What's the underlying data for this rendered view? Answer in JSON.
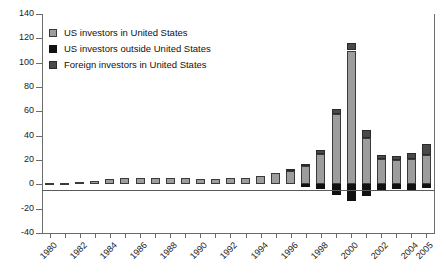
{
  "chart_data": {
    "type": "bar",
    "stacked": true,
    "title": "",
    "subtitle": "",
    "xlabel": "",
    "ylabel": "",
    "ylim": [
      -40,
      140
    ],
    "ytick_step": 20,
    "yticks": [
      140,
      120,
      100,
      80,
      60,
      40,
      20,
      0,
      -20,
      -40
    ],
    "ytick_labels": [
      "140",
      "120",
      "100",
      "80",
      "60",
      "40",
      "20",
      "0",
      "-20",
      "-40"
    ],
    "grid": false,
    "legend_position": "top-left",
    "x": [
      1980,
      1981,
      1982,
      1983,
      1984,
      1985,
      1986,
      1987,
      1988,
      1989,
      1990,
      1991,
      1992,
      1993,
      1994,
      1995,
      1996,
      1997,
      1998,
      1999,
      2000,
      2001,
      2002,
      2003,
      2004,
      2005
    ],
    "categories": [
      "1980",
      "1981",
      "1982",
      "1983",
      "1984",
      "1985",
      "1986",
      "1987",
      "1988",
      "1989",
      "1990",
      "1991",
      "1992",
      "1993",
      "1994",
      "1995",
      "1996",
      "1997",
      "1998",
      "1999",
      "2000",
      "2001",
      "2002",
      "2003",
      "2004",
      "2005"
    ],
    "xtick_labels": [
      "1980",
      "1982",
      "1984",
      "1986",
      "1988",
      "1990",
      "1992",
      "1994",
      "1996",
      "1998",
      "2000",
      "2002",
      "2004",
      "2005"
    ],
    "series": [
      {
        "name": "US investors in United States",
        "color": "#9d9d9d",
        "values": [
          1,
          1,
          2,
          3,
          4,
          5,
          5,
          5,
          5,
          5,
          4,
          4,
          5,
          5,
          7,
          9,
          11,
          15,
          25,
          58,
          110,
          38,
          21,
          20,
          21,
          24
        ]
      },
      {
        "name": "Foreign investors in United States",
        "color": "#4a4a4a",
        "values": [
          0,
          0,
          0,
          0,
          0,
          0,
          0,
          0,
          0,
          0,
          0,
          0,
          0,
          0,
          0,
          0,
          1,
          2,
          3,
          4,
          6,
          7,
          3,
          3,
          5,
          9
        ]
      },
      {
        "name": "US investors outside United States",
        "color": "#111111",
        "values": [
          0,
          0,
          0,
          0,
          0,
          0,
          0,
          0,
          0,
          0,
          0,
          0,
          0,
          0,
          0,
          0,
          0,
          -2,
          -4,
          -9,
          -14,
          -10,
          -5,
          -4,
          -5,
          -3
        ]
      }
    ],
    "totals": [
      1,
      1,
      2,
      3,
      4,
      5,
      5,
      5,
      5,
      5,
      4,
      4,
      5,
      5,
      7,
      9,
      12,
      17,
      28,
      62,
      116,
      45,
      24,
      23,
      26,
      33
    ]
  },
  "legend": {
    "items": [
      {
        "label": "US investors in United States",
        "swatch": "light-gray-square-icon"
      },
      {
        "label": "US investors outside United States",
        "swatch": "black-square-icon"
      },
      {
        "label": "Foreign investors in United States",
        "swatch": "dark-gray-square-icon"
      }
    ]
  },
  "colors": {
    "us_in_us": "#9d9d9d",
    "us_outside_us": "#111111",
    "foreign_in_us": "#4a4a4a",
    "axis": "#6b6b6b",
    "text": "#1b1b1b",
    "background": "#ffffff"
  }
}
